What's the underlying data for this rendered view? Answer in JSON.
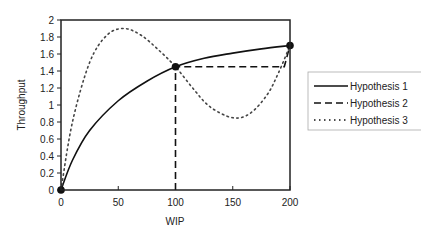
{
  "chart_data": {
    "type": "line",
    "title": "",
    "xlabel": "WIP",
    "ylabel": "Throughput",
    "xlim": [
      0,
      200
    ],
    "ylim": [
      0,
      2
    ],
    "x_ticks": [
      "0",
      "50",
      "100",
      "150",
      "200"
    ],
    "y_ticks": [
      "0",
      "0.2",
      "0.4",
      "0.6",
      "0.8",
      "1",
      "1.2",
      "1.4",
      "1.6",
      "1.8",
      "2"
    ],
    "grid": false,
    "legend_position": "right",
    "series": [
      {
        "name": "Hypothesis 1",
        "style": "solid",
        "x": [
          0,
          10,
          25,
          50,
          75,
          100,
          125,
          150,
          175,
          200
        ],
        "y": [
          0,
          0.35,
          0.7,
          1.05,
          1.28,
          1.45,
          1.55,
          1.61,
          1.66,
          1.7
        ]
      },
      {
        "name": "Hypothesis 2",
        "style": "dashed",
        "x": [
          100,
          100,
          195,
          200
        ],
        "y": [
          0,
          1.45,
          1.45,
          1.7
        ]
      },
      {
        "name": "Hypothesis 3",
        "style": "dotted",
        "x": [
          0,
          10,
          25,
          40,
          55,
          70,
          85,
          100,
          115,
          130,
          150,
          165,
          180,
          190,
          200
        ],
        "y": [
          0,
          0.8,
          1.5,
          1.82,
          1.9,
          1.82,
          1.65,
          1.45,
          1.2,
          0.98,
          0.85,
          0.9,
          1.12,
          1.38,
          1.7
        ]
      }
    ],
    "markers": [
      {
        "x": 0,
        "y": 0
      },
      {
        "x": 100,
        "y": 1.45
      },
      {
        "x": 200,
        "y": 1.7
      }
    ]
  }
}
